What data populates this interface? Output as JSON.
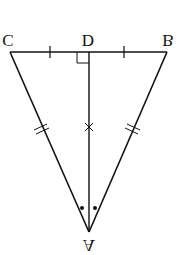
{
  "figure": {
    "orientation": "flipped-vertically",
    "stroke_color": "#111111",
    "background": "#ffffff",
    "points": {
      "A": {
        "label": "A",
        "x": 89,
        "y": 232
      },
      "B": {
        "label": "B",
        "x": 167,
        "y": 52
      },
      "C": {
        "label": "C",
        "x": 10,
        "y": 52
      },
      "D": {
        "label": "D",
        "x": 89,
        "y": 52
      }
    },
    "segments": [
      {
        "from": "B",
        "to": "C",
        "name": "base-bc"
      },
      {
        "from": "A",
        "to": "B",
        "name": "side-ab",
        "marks": "double-tick"
      },
      {
        "from": "A",
        "to": "C",
        "name": "side-ac",
        "marks": "double-tick"
      },
      {
        "from": "A",
        "to": "D",
        "name": "median-ad",
        "marks": "cross"
      }
    ],
    "annotations": {
      "right_angle_at": "D",
      "equal_segments_bd_dc": "single-tick",
      "equal_angles_at_A": "dots"
    }
  }
}
